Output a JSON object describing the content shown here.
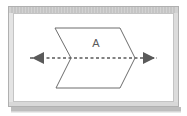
{
  "figure": {
    "background_color": "#ffffff"
  },
  "frame": {
    "name": "display-frame",
    "outer_rect": {
      "x": 8,
      "y": 6,
      "width": 171,
      "height": 101
    },
    "border_color": "#b7b7b7",
    "bezel_fill": "#e8e8e8",
    "inner_rect": {
      "x": 13,
      "y": 11,
      "width": 161,
      "height": 91
    },
    "inner_fill": "#ffffff",
    "top_band_color": "#c9c9c9",
    "shadow_bar": {
      "x": 11,
      "y": 107,
      "width": 170,
      "height": 5
    },
    "shadow_color": "#bcbcbc"
  },
  "shape": {
    "name": "chevron-block",
    "label": "A",
    "label_x": 96,
    "label_y": 44,
    "outline_color": "#6d6d6d",
    "fill_color": "#ffffff",
    "stroke_width": 1,
    "points": "55,28 120,28 135,58 120,88 56,88 71,58"
  },
  "axis": {
    "name": "horizontal-axis-arrow",
    "color": "#5a5a5a",
    "stroke_width": 1.4,
    "dash_pattern": "3,2.5",
    "line_y": 58,
    "line_x1": 30,
    "line_x2": 157,
    "left_arrowhead": "32,58 44,52 44,64",
    "right_arrowhead": "155,58 143,52 143,64"
  }
}
